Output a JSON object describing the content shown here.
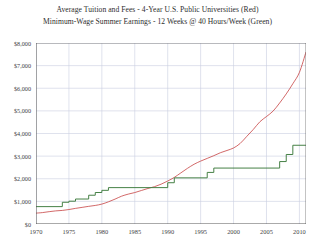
{
  "title": {
    "line1": "Average Tuition and Fees - 4-Year U.S. Public Universities (Red)",
    "line2": "Minimum-Wage Summer Earnings - 12 Weeks @ 40 Hours/Week (Green)"
  },
  "colors": {
    "tuition": "#c43a3a",
    "minwage": "#3c7a3c",
    "grid": "#c9cfe0",
    "axis": "#555555",
    "background": "#ffffff",
    "text": "#2e2e2e"
  },
  "chart_data": {
    "type": "line",
    "xlabel": "",
    "ylabel": "",
    "xlim": [
      1970,
      2011
    ],
    "ylim": [
      0,
      8000
    ],
    "grid": true,
    "legend_position": "in-title",
    "xticks": [
      1970,
      1975,
      1980,
      1985,
      1990,
      1995,
      2000,
      2005,
      2010
    ],
    "xtick_labels": [
      "1970",
      "1975",
      "1980",
      "1985",
      "1990",
      "1995",
      "2000",
      "2005",
      "2010"
    ],
    "yticks": [
      0,
      1000,
      2000,
      3000,
      4000,
      5000,
      6000,
      7000,
      8000
    ],
    "ytick_labels": [
      "$0",
      "$1,000",
      "$2,000",
      "$3,000",
      "$4,000",
      "$5,000",
      "$6,000",
      "$7,000",
      "$8,000"
    ],
    "series": [
      {
        "name": "Average Tuition and Fees - 4-Year U.S. Public Universities",
        "color": "#c43a3a",
        "style": "smooth",
        "x": [
          1970,
          1971,
          1972,
          1973,
          1974,
          1975,
          1976,
          1977,
          1978,
          1979,
          1980,
          1981,
          1982,
          1983,
          1984,
          1985,
          1986,
          1987,
          1988,
          1989,
          1990,
          1991,
          1992,
          1993,
          1994,
          1995,
          1996,
          1997,
          1998,
          1999,
          2000,
          2001,
          2002,
          2003,
          2004,
          2005,
          2006,
          2007,
          2008,
          2009,
          2010,
          2011
        ],
        "values": [
          480,
          505,
          545,
          580,
          600,
          640,
          690,
          735,
          780,
          820,
          880,
          980,
          1100,
          1230,
          1320,
          1390,
          1480,
          1570,
          1650,
          1760,
          1900,
          2060,
          2260,
          2460,
          2640,
          2780,
          2900,
          3020,
          3150,
          3250,
          3360,
          3560,
          3870,
          4180,
          4520,
          4750,
          4990,
          5350,
          5750,
          6200,
          6700,
          7600
        ]
      },
      {
        "name": "Minimum-Wage Summer Earnings - 12 Weeks @ 40 Hours/Week",
        "color": "#3c7a3c",
        "style": "step",
        "x": [
          1970,
          1974,
          1975,
          1976,
          1978,
          1979,
          1980,
          1981,
          1990,
          1991,
          1996,
          1997,
          2007,
          2008,
          2009,
          2011
        ],
        "values": [
          768,
          960,
          1008,
          1104,
          1272,
          1392,
          1488,
          1608,
          1824,
          2040,
          2280,
          2472,
          2760,
          3072,
          3480,
          3480
        ]
      }
    ],
    "annotations": []
  },
  "axes": {
    "y_tick_labels": [
      "$8,000",
      "$7,000",
      "$6,000",
      "$5,000",
      "$4,000",
      "$3,000",
      "$2,000",
      "$1,000",
      "$0"
    ],
    "x_tick_labels": [
      "1970",
      "1975",
      "1980",
      "1985",
      "1990",
      "1995",
      "2000",
      "2005",
      "2010"
    ]
  }
}
